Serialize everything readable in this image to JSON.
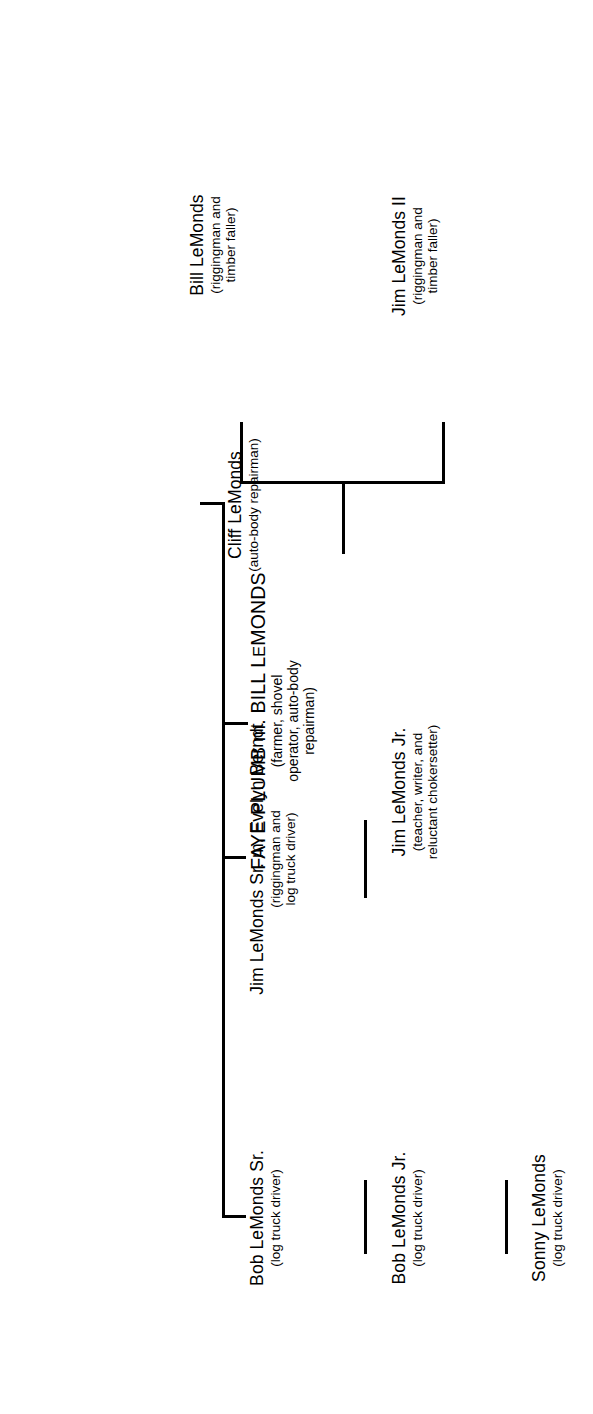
{
  "diagram": {
    "type": "family-tree",
    "orientation": "rotated-90-ccw",
    "line_color": "#000000",
    "background_color": "#ffffff",
    "text_color": "#000000"
  },
  "nodes": {
    "root": {
      "name_part_1": "FAYE PLUMB",
      "name_part_2": "m.",
      "name_part_3": "BILL L",
      "name_part_4": "E",
      "name_part_5": "MONDS",
      "name_full": "FAYE PLUMB m. BILL LeMONDS",
      "occupation": "(farmer, shovel\noperator, auto-body\nrepairman)"
    },
    "bob_sr": {
      "name": "Bob LeMonds Sr.",
      "occupation": "(log truck driver)"
    },
    "bob_jr": {
      "name": "Bob LeMonds Jr.",
      "occupation": "(log truck driver)"
    },
    "sonny": {
      "name": "Sonny LeMonds",
      "occupation": "(log truck driver)"
    },
    "jim_sr": {
      "name": "Jim LeMonds Sr. m. Evelyn Berndt",
      "occupation": "(riggingman and\nlog truck driver)"
    },
    "jim_jr": {
      "name": "Jim LeMonds Jr.",
      "occupation": "(teacher, writer, and\nreluctant chokersetter)"
    },
    "cliff": {
      "name": "Cliff LeMonds",
      "occupation": "(auto-body repairman)"
    },
    "jim_ii": {
      "name": "Jim LeMonds II",
      "occupation": "(riggingman and\ntimber faller)"
    },
    "bill": {
      "name": "Bill LeMonds",
      "occupation": "(riggingman and\ntimber faller)"
    }
  }
}
